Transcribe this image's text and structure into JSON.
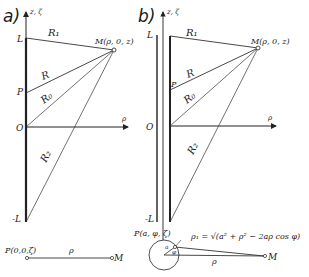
{
  "figure": {
    "panel_a": {
      "label": "a)",
      "axis_z": "z, ζ",
      "axis_rho": "ρ",
      "tick_L": "L",
      "tick_P": "P",
      "tick_O": "O",
      "tick_minus_L": "-L",
      "point_M": "M(ρ, 0, z)",
      "seg_R1": "R₁",
      "seg_R": "R",
      "seg_R0": "R₀",
      "seg_R2": "R₂",
      "bottom_point_P": "P(0,0,ζ)",
      "bottom_rho": "ρ",
      "bottom_M": "M"
    },
    "panel_b": {
      "label": "b)",
      "axis_z": "z, ζ",
      "axis_rho": "ρ",
      "tick_L": "L",
      "tick_P": "P",
      "tick_O": "O",
      "tick_minus_L": "-L",
      "point_M": "M(ρ, 0, z)",
      "seg_R1": "R₁",
      "seg_R": "R",
      "seg_R0": "R₀",
      "seg_R2": "R₂",
      "bottom_point_P": "P(a, φ, ζ)",
      "formula": "ρ₁ = √(a² + ρ² − 2aρ cos φ)",
      "angle_a": "a",
      "angle_phi": "φ",
      "bottom_rho": "ρ",
      "bottom_M": "M"
    },
    "colors": {
      "line": "#222222",
      "thin_line": "#333333",
      "background": "#ffffff"
    }
  }
}
